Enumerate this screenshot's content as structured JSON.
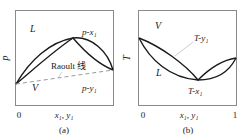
{
  "panels": [
    {
      "id": "a",
      "caption": "(a)",
      "y_axis_label": "p",
      "x_axis_label": "x₁, y₁",
      "x_tick_left": "0",
      "region_top": "L",
      "region_bottom": "V",
      "curve_upper_label": "p-x₁",
      "curve_lower_label": "p-y₁",
      "reference_line_label": "Raoult 线"
    },
    {
      "id": "b",
      "caption": "(b)",
      "y_axis_label": "T",
      "x_axis_label": "x₁, y₁",
      "x_tick_left": "0",
      "x_tick_right": "1",
      "region_top": "V",
      "region_bottom": "L",
      "curve_upper_label": "T-y₁",
      "curve_lower_label": "T-x₁"
    }
  ],
  "colors": {
    "frame": "#8a8a8a",
    "curve": "#1a1a1a",
    "dashed": "#9a9a9a",
    "leader": "#aaaaaa"
  }
}
